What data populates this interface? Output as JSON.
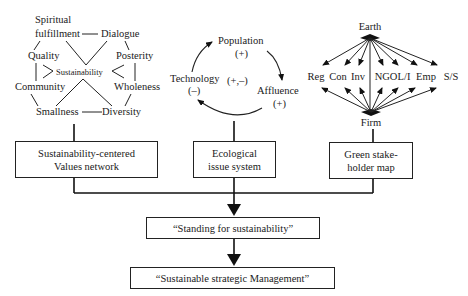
{
  "values_network": {
    "nodes": {
      "spiritual_line1": "Spiritual",
      "spiritual_line2": "fulfillment",
      "dialogue": "Dialogue",
      "quality": "Quality",
      "posterity": "Posterity",
      "center": "Sustainability",
      "community": "Community",
      "wholeness": "Wholeness",
      "smallness": "Smallness",
      "diversity": "Diversity"
    },
    "box_line1": "Sustainability-centered",
    "box_line2": "Values network"
  },
  "ecological_system": {
    "population": "Population",
    "population_sign": "(+)",
    "affluence": "Affluence",
    "affluence_sign": "(+)",
    "technology": "Technology",
    "technology_sign": "(–)",
    "center_sign": "(+,–)",
    "box_line1": "Ecological",
    "box_line2": "issue system"
  },
  "stakeholder_map": {
    "top": "Earth",
    "bottom": "Firm",
    "stakeholders": [
      "Reg",
      "Con",
      "Inv",
      "NGO",
      "L/I",
      "Emp",
      "S/S"
    ],
    "box_line1": "Green stake-",
    "box_line2": "holder map"
  },
  "outcomes": {
    "standing": "“Standing for sustainability”",
    "management": "“Sustainable strategic Management”"
  }
}
